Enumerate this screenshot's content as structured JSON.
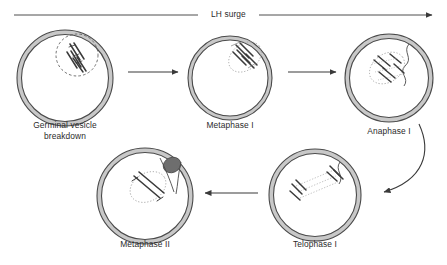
{
  "diagram": {
    "background_color": "#ffffff",
    "top_arrow": {
      "label": "LH surge",
      "direction": "right",
      "color": "#3a3a3a"
    },
    "colors": {
      "membrane_stroke": "#4a4a4a",
      "zona_fill": "#c8c8c8",
      "cytoplasm_fill": "#ffffff",
      "chromosome": "#3a3a3a",
      "spindle_dotted": "#9a9a9a",
      "polar_body": "#6e6e6e",
      "arrow": "#3a3a3a",
      "text": "#2b2b2b"
    },
    "stages": [
      {
        "id": "germinal-vesicle-breakdown",
        "label": "Germinal vesicle\nbreakdown",
        "cx": 65,
        "cy": 78,
        "r": 48,
        "label_x": 65,
        "label_y": 124,
        "has_nucleus": true,
        "has_polar_body": false,
        "spindle": "none"
      },
      {
        "id": "metaphase-1",
        "label": "Metaphase I",
        "cx": 230,
        "cy": 78,
        "r": 42,
        "label_x": 230,
        "label_y": 124,
        "has_nucleus": false,
        "has_polar_body": false,
        "spindle": "metaphase"
      },
      {
        "id": "anaphase-1",
        "label": "Anaphase I",
        "cx": 389,
        "cy": 78,
        "r": 44,
        "label_x": 389,
        "label_y": 130,
        "has_nucleus": false,
        "has_polar_body": false,
        "spindle": "anaphase"
      },
      {
        "id": "telophase-1",
        "label": "Telophase I",
        "cx": 315,
        "cy": 195,
        "r": 46,
        "label_x": 315,
        "label_y": 243,
        "has_nucleus": false,
        "has_polar_body": false,
        "spindle": "telophase"
      },
      {
        "id": "metaphase-2",
        "label": "Metaphase II",
        "cx": 145,
        "cy": 196,
        "r": 48,
        "label_x": 145,
        "label_y": 243,
        "has_nucleus": false,
        "has_polar_body": true,
        "spindle": "metaphase2"
      }
    ],
    "connectors": [
      {
        "id": "gvbd-to-metaphase1",
        "type": "straight",
        "direction": "right"
      },
      {
        "id": "metaphase1-to-anaphase1",
        "type": "straight",
        "direction": "right"
      },
      {
        "id": "anaphase1-to-telophase1",
        "type": "curved",
        "direction": "down-left"
      },
      {
        "id": "telophase1-to-metaphase2",
        "type": "straight",
        "direction": "left"
      }
    ]
  }
}
